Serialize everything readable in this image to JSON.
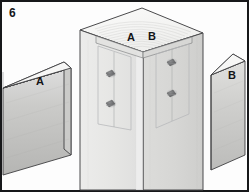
{
  "figure": {
    "number": "6",
    "type": "technical-line-illustration",
    "border_color": "#17181a",
    "background_color": "#fdfdfd"
  },
  "labels": {
    "post_face_left": "A",
    "post_face_right": "B",
    "board_left": "A",
    "board_right": "B"
  },
  "parts": {
    "post": {
      "name": "square-post",
      "description": "Vertical square post shown in isometric view with end grain rings visible on top",
      "top_face_fill": "#f4f4f2",
      "left_face_fill": "#e8e8e6",
      "right_face_fill": "#dcdcda",
      "outline_color": "#4a4a4c",
      "grain_rings": 11,
      "grain_color": "#c2c2c0"
    },
    "board_a": {
      "name": "board-a",
      "label": "A",
      "description": "Left board slab, wider face, runs off the left edge of the frame",
      "top_face_fill": "#f6f6f5",
      "front_face_fill_top": "#d8d8d6",
      "front_face_fill_bottom": "#b9b9b7",
      "end_face_fill": "#cfcfcd",
      "outline_color": "#3f4042"
    },
    "board_b": {
      "name": "board-b",
      "label": "B",
      "description": "Right board slab, narrower, angled, runs off the right edge of the frame",
      "top_face_fill": "#f6f6f5",
      "front_face_fill_top": "#dadad8",
      "front_face_fill_bottom": "#c0c0be",
      "outline_color": "#3f4042"
    }
  },
  "fasteners": {
    "count": 4,
    "description": "Screw heads set into counterbored holes marking board attachment points",
    "head_color": "#6f7072",
    "shadow_color": "#9b9c9e",
    "left_face": [
      {
        "name": "screw-left-upper",
        "cx": 110,
        "cy": 74
      },
      {
        "name": "screw-left-lower",
        "cx": 110,
        "cy": 104
      }
    ],
    "right_face": [
      {
        "name": "screw-right-upper",
        "cx": 172,
        "cy": 62
      },
      {
        "name": "screw-right-lower",
        "cx": 172,
        "cy": 93
      }
    ]
  },
  "guides": {
    "description": "Faint rectangular outlines on each post face showing where boards A and B land, each with a vertical centerline",
    "outline_color": "#b6b7b9",
    "centerline_color": "#aaabad"
  }
}
